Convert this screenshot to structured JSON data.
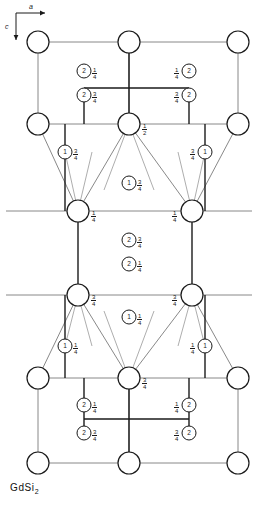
{
  "figure": {
    "caption": "GdSi",
    "caption_subscript": "2",
    "axes": {
      "horizontal_label": "a",
      "vertical_label": "c"
    },
    "colors": {
      "stroke": "#1a1a1a",
      "thin_stroke": "#555555",
      "background": "#ffffff"
    },
    "large_atoms": [
      {
        "name": "gd-corner-top-left",
        "cx": 38,
        "cy": 42,
        "r": 11,
        "label": ""
      },
      {
        "name": "gd-top-center",
        "cx": 129,
        "cy": 42,
        "r": 11,
        "label": ""
      },
      {
        "name": "gd-corner-top-right",
        "cx": 238,
        "cy": 42,
        "r": 11,
        "label": ""
      },
      {
        "name": "gd-left-upper",
        "cx": 38,
        "cy": 124,
        "r": 11,
        "label": ""
      },
      {
        "name": "gd-center-upper",
        "cx": 129,
        "cy": 124,
        "r": 11,
        "label": "1/2"
      },
      {
        "name": "gd-right-upper",
        "cx": 238,
        "cy": 124,
        "r": 11,
        "label": ""
      },
      {
        "name": "gd-mid-left",
        "cx": 78,
        "cy": 211,
        "r": 11,
        "label": "1/4"
      },
      {
        "name": "gd-mid-right",
        "cx": 192,
        "cy": 211,
        "r": 11,
        "label": "1/4"
      },
      {
        "name": "gd-lower-left",
        "cx": 78,
        "cy": 295,
        "r": 11,
        "label": "3/4"
      },
      {
        "name": "gd-lower-right",
        "cx": 192,
        "cy": 295,
        "r": 11,
        "label": "3/4"
      },
      {
        "name": "gd-bottom-center-upper",
        "cx": 129,
        "cy": 378,
        "r": 11,
        "label": "3/4"
      },
      {
        "name": "gd-left-lower",
        "cx": 38,
        "cy": 378,
        "r": 11,
        "label": ""
      },
      {
        "name": "gd-right-lower",
        "cx": 238,
        "cy": 378,
        "r": 11,
        "label": ""
      },
      {
        "name": "gd-corner-bottom-left",
        "cx": 38,
        "cy": 463,
        "r": 11,
        "label": ""
      },
      {
        "name": "gd-bottom-center",
        "cx": 129,
        "cy": 463,
        "r": 11,
        "label": ""
      },
      {
        "name": "gd-corner-bottom-right",
        "cx": 238,
        "cy": 463,
        "r": 11,
        "label": ""
      }
    ],
    "site_atoms": [
      {
        "name": "si-site-1",
        "cx": 84,
        "cy": 71,
        "r": 7,
        "site": "2",
        "frac": "1/4",
        "side": "right"
      },
      {
        "name": "si-site-2",
        "cx": 189,
        "cy": 71,
        "r": 7,
        "site": "2",
        "frac": "1/4",
        "side": "left"
      },
      {
        "name": "si-site-3",
        "cx": 84,
        "cy": 95,
        "r": 7,
        "site": "2",
        "frac": "3/4",
        "side": "right"
      },
      {
        "name": "si-site-4",
        "cx": 189,
        "cy": 95,
        "r": 7,
        "site": "2",
        "frac": "3/4",
        "side": "left"
      },
      {
        "name": "si-site-5",
        "cx": 65,
        "cy": 152,
        "r": 7,
        "site": "1",
        "frac": "3/4",
        "side": "right"
      },
      {
        "name": "si-site-6",
        "cx": 205,
        "cy": 152,
        "r": 7,
        "site": "1",
        "frac": "3/4",
        "side": "left"
      },
      {
        "name": "si-site-7",
        "cx": 129,
        "cy": 183,
        "r": 7,
        "site": "1",
        "frac": "3/4",
        "side": "right"
      },
      {
        "name": "si-site-8",
        "cx": 129,
        "cy": 240,
        "r": 7,
        "site": "2",
        "frac": "3/4",
        "side": "right"
      },
      {
        "name": "si-site-9",
        "cx": 129,
        "cy": 264,
        "r": 7,
        "site": "2",
        "frac": "1/4",
        "side": "right"
      },
      {
        "name": "si-site-10",
        "cx": 129,
        "cy": 317,
        "r": 7,
        "site": "1",
        "frac": "1/4",
        "side": "right"
      },
      {
        "name": "si-site-11",
        "cx": 65,
        "cy": 346,
        "r": 7,
        "site": "1",
        "frac": "1/4",
        "side": "right"
      },
      {
        "name": "si-site-12",
        "cx": 205,
        "cy": 346,
        "r": 7,
        "site": "1",
        "frac": "1/4",
        "side": "left"
      },
      {
        "name": "si-site-13",
        "cx": 84,
        "cy": 405,
        "r": 7,
        "site": "2",
        "frac": "1/4",
        "side": "right"
      },
      {
        "name": "si-site-14",
        "cx": 189,
        "cy": 405,
        "r": 7,
        "site": "2",
        "frac": "1/4",
        "side": "left"
      },
      {
        "name": "si-site-15",
        "cx": 84,
        "cy": 433,
        "r": 7,
        "site": "2",
        "frac": "3/4",
        "side": "right"
      },
      {
        "name": "si-site-16",
        "cx": 189,
        "cy": 433,
        "r": 7,
        "site": "2",
        "frac": "3/4",
        "side": "left"
      }
    ]
  }
}
